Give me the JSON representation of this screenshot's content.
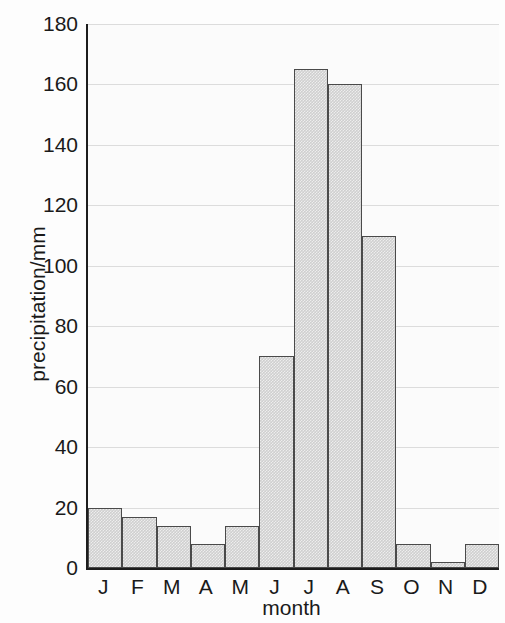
{
  "chart_data": {
    "type": "bar",
    "title": "",
    "xlabel": "month",
    "ylabel": "precipitation/mm",
    "categories": [
      "J",
      "F",
      "M",
      "A",
      "M",
      "J",
      "J",
      "A",
      "S",
      "O",
      "N",
      "D"
    ],
    "values": [
      20,
      17,
      14,
      8,
      14,
      70,
      165,
      160,
      110,
      8,
      2,
      8
    ],
    "ylim": [
      0,
      180
    ],
    "ytick_values": [
      0,
      20,
      40,
      60,
      80,
      100,
      120,
      140,
      160,
      180
    ],
    "ytick_labels": [
      "0",
      "20",
      "40",
      "60",
      "80",
      "100",
      "120",
      "140",
      "160",
      "180"
    ],
    "grid": true,
    "legend": null,
    "colors": {
      "bar_fill": "#cfcfcf",
      "bar_edge": "#4a4a4a",
      "axis": "#1d1d1d",
      "grid": "#dcdcdc",
      "text": "#1a1a1a",
      "background": "#fdfdfd"
    }
  }
}
